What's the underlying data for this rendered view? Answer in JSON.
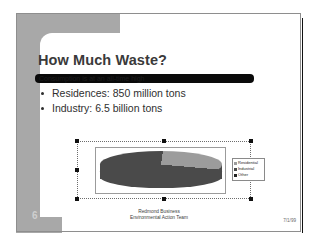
{
  "slide": {
    "title": "How Much Waste?",
    "highlight_bar_text": "Consumption is at an all-time high",
    "bullets": [
      "Residences: 850 million tons",
      "Industry: 6.5 billion tons"
    ],
    "page_number": "6",
    "footer_line1": "Redmond Business",
    "footer_line2": "Environmental Action Team",
    "footer_date": "7/1/99"
  },
  "colors": {
    "band_gray": "#a8a8a8",
    "title_gray": "#3a3a3a",
    "highlight_black": "#0a0a0a",
    "pie_dark": "#4a4a4a",
    "pie_light": "#9c9c9c",
    "shadow_black": "#111111"
  },
  "chart_data": {
    "type": "pie",
    "title": "",
    "categories": [
      "Residential",
      "Industrial",
      "Other"
    ],
    "values": [
      24,
      74,
      2
    ],
    "legend": [
      "Residential",
      "Industrial",
      "Other"
    ],
    "legend_position": "right",
    "swatch_colors": [
      "#9c9c9c",
      "#4a4a4a",
      "#222222"
    ],
    "three_d": true,
    "grid": false
  },
  "selection": {
    "handles": [
      "top-left",
      "top-center",
      "top-right",
      "middle-left",
      "middle-right",
      "bottom-left",
      "bottom-center",
      "bottom-right"
    ]
  }
}
